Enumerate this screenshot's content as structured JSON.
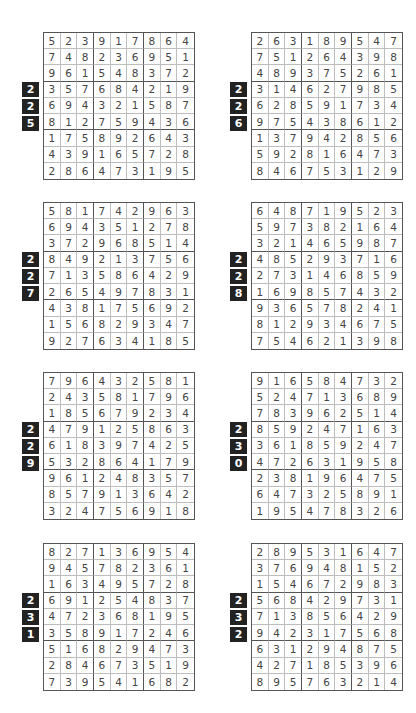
{
  "puzzles": [
    {
      "number": [
        "2",
        "2",
        "5"
      ],
      "rows": [
        [
          "5",
          "2",
          "3",
          "9",
          "1",
          "7",
          "8",
          "6",
          "4"
        ],
        [
          "7",
          "4",
          "8",
          "2",
          "3",
          "6",
          "9",
          "5",
          "1"
        ],
        [
          "9",
          "6",
          "1",
          "5",
          "4",
          "8",
          "3",
          "7",
          "2"
        ],
        [
          "3",
          "5",
          "7",
          "6",
          "8",
          "4",
          "2",
          "1",
          "9"
        ],
        [
          "6",
          "9",
          "4",
          "3",
          "2",
          "1",
          "5",
          "8",
          "7"
        ],
        [
          "8",
          "1",
          "2",
          "7",
          "5",
          "9",
          "4",
          "3",
          "6"
        ],
        [
          "1",
          "7",
          "5",
          "8",
          "9",
          "2",
          "6",
          "4",
          "3"
        ],
        [
          "4",
          "3",
          "9",
          "1",
          "6",
          "5",
          "7",
          "2",
          "8"
        ],
        [
          "2",
          "8",
          "6",
          "4",
          "7",
          "3",
          "1",
          "9",
          "5"
        ]
      ]
    },
    {
      "number": [
        "2",
        "2",
        "6"
      ],
      "rows": [
        [
          "2",
          "6",
          "3",
          "1",
          "8",
          "9",
          "5",
          "4",
          "7"
        ],
        [
          "7",
          "5",
          "1",
          "2",
          "6",
          "4",
          "3",
          "9",
          "8"
        ],
        [
          "4",
          "8",
          "9",
          "3",
          "7",
          "5",
          "2",
          "6",
          "1"
        ],
        [
          "3",
          "1",
          "4",
          "6",
          "2",
          "7",
          "9",
          "8",
          "5"
        ],
        [
          "6",
          "2",
          "8",
          "5",
          "9",
          "1",
          "7",
          "3",
          "4"
        ],
        [
          "9",
          "7",
          "5",
          "4",
          "3",
          "8",
          "6",
          "1",
          "2"
        ],
        [
          "1",
          "3",
          "7",
          "9",
          "4",
          "2",
          "8",
          "5",
          "6"
        ],
        [
          "5",
          "9",
          "2",
          "8",
          "1",
          "6",
          "4",
          "7",
          "3"
        ],
        [
          "8",
          "4",
          "6",
          "7",
          "5",
          "3",
          "1",
          "2",
          "9"
        ]
      ]
    },
    {
      "number": [
        "2",
        "2",
        "7"
      ],
      "rows": [
        [
          "5",
          "8",
          "1",
          "7",
          "4",
          "2",
          "9",
          "6",
          "3"
        ],
        [
          "6",
          "9",
          "4",
          "3",
          "5",
          "1",
          "2",
          "7",
          "8"
        ],
        [
          "3",
          "7",
          "2",
          "9",
          "6",
          "8",
          "5",
          "1",
          "4"
        ],
        [
          "8",
          "4",
          "9",
          "2",
          "1",
          "3",
          "7",
          "5",
          "6"
        ],
        [
          "7",
          "1",
          "3",
          "5",
          "8",
          "6",
          "4",
          "2",
          "9"
        ],
        [
          "2",
          "6",
          "5",
          "4",
          "9",
          "7",
          "8",
          "3",
          "1"
        ],
        [
          "4",
          "3",
          "8",
          "1",
          "7",
          "5",
          "6",
          "9",
          "2"
        ],
        [
          "1",
          "5",
          "6",
          "8",
          "2",
          "9",
          "3",
          "4",
          "7"
        ],
        [
          "9",
          "2",
          "7",
          "6",
          "3",
          "4",
          "1",
          "8",
          "5"
        ]
      ]
    },
    {
      "number": [
        "2",
        "2",
        "8"
      ],
      "rows": [
        [
          "6",
          "4",
          "8",
          "7",
          "1",
          "9",
          "5",
          "2",
          "3"
        ],
        [
          "5",
          "9",
          "7",
          "3",
          "8",
          "2",
          "1",
          "6",
          "4"
        ],
        [
          "3",
          "2",
          "1",
          "4",
          "6",
          "5",
          "9",
          "8",
          "7"
        ],
        [
          "4",
          "8",
          "5",
          "2",
          "9",
          "3",
          "7",
          "1",
          "6"
        ],
        [
          "2",
          "7",
          "3",
          "1",
          "4",
          "6",
          "8",
          "5",
          "9"
        ],
        [
          "1",
          "6",
          "9",
          "8",
          "5",
          "7",
          "4",
          "3",
          "2"
        ],
        [
          "9",
          "3",
          "6",
          "5",
          "7",
          "8",
          "2",
          "4",
          "1"
        ],
        [
          "8",
          "1",
          "2",
          "9",
          "3",
          "4",
          "6",
          "7",
          "5"
        ],
        [
          "7",
          "5",
          "4",
          "6",
          "2",
          "1",
          "3",
          "9",
          "8"
        ]
      ]
    },
    {
      "number": [
        "2",
        "2",
        "9"
      ],
      "rows": [
        [
          "7",
          "9",
          "6",
          "4",
          "3",
          "2",
          "5",
          "8",
          "1"
        ],
        [
          "2",
          "4",
          "3",
          "5",
          "8",
          "1",
          "7",
          "9",
          "6"
        ],
        [
          "1",
          "8",
          "5",
          "6",
          "7",
          "9",
          "2",
          "3",
          "4"
        ],
        [
          "4",
          "7",
          "9",
          "1",
          "2",
          "5",
          "8",
          "6",
          "3"
        ],
        [
          "6",
          "1",
          "8",
          "3",
          "9",
          "7",
          "4",
          "2",
          "5"
        ],
        [
          "5",
          "3",
          "2",
          "8",
          "6",
          "4",
          "1",
          "7",
          "9"
        ],
        [
          "9",
          "6",
          "1",
          "2",
          "4",
          "8",
          "3",
          "5",
          "7"
        ],
        [
          "8",
          "5",
          "7",
          "9",
          "1",
          "3",
          "6",
          "4",
          "2"
        ],
        [
          "3",
          "2",
          "4",
          "7",
          "5",
          "6",
          "9",
          "1",
          "8"
        ]
      ]
    },
    {
      "number": [
        "2",
        "3",
        "0"
      ],
      "rows": [
        [
          "9",
          "1",
          "6",
          "5",
          "8",
          "4",
          "7",
          "3",
          "2"
        ],
        [
          "5",
          "2",
          "4",
          "7",
          "1",
          "3",
          "6",
          "8",
          "9"
        ],
        [
          "7",
          "8",
          "3",
          "9",
          "6",
          "2",
          "5",
          "1",
          "4"
        ],
        [
          "8",
          "5",
          "9",
          "2",
          "4",
          "7",
          "1",
          "6",
          "3"
        ],
        [
          "3",
          "6",
          "1",
          "8",
          "5",
          "9",
          "2",
          "4",
          "7"
        ],
        [
          "4",
          "7",
          "2",
          "6",
          "3",
          "1",
          "9",
          "5",
          "8"
        ],
        [
          "2",
          "3",
          "8",
          "1",
          "9",
          "6",
          "4",
          "7",
          "5"
        ],
        [
          "6",
          "4",
          "7",
          "3",
          "2",
          "5",
          "8",
          "9",
          "1"
        ],
        [
          "1",
          "9",
          "5",
          "4",
          "7",
          "8",
          "3",
          "2",
          "6"
        ]
      ]
    },
    {
      "number": [
        "2",
        "3",
        "1"
      ],
      "rows": [
        [
          "8",
          "2",
          "7",
          "1",
          "3",
          "6",
          "9",
          "5",
          "4"
        ],
        [
          "9",
          "4",
          "5",
          "7",
          "8",
          "2",
          "3",
          "6",
          "1"
        ],
        [
          "1",
          "6",
          "3",
          "4",
          "9",
          "5",
          "7",
          "2",
          "8"
        ],
        [
          "6",
          "9",
          "1",
          "2",
          "5",
          "4",
          "8",
          "3",
          "7"
        ],
        [
          "4",
          "7",
          "2",
          "3",
          "6",
          "8",
          "1",
          "9",
          "5"
        ],
        [
          "3",
          "5",
          "8",
          "9",
          "1",
          "7",
          "2",
          "4",
          "6"
        ],
        [
          "5",
          "1",
          "6",
          "8",
          "2",
          "9",
          "4",
          "7",
          "3"
        ],
        [
          "2",
          "8",
          "4",
          "6",
          "7",
          "3",
          "5",
          "1",
          "9"
        ],
        [
          "7",
          "3",
          "9",
          "5",
          "4",
          "1",
          "6",
          "8",
          "2"
        ]
      ]
    },
    {
      "number": [
        "2",
        "3",
        "2"
      ],
      "rows": [
        [
          "2",
          "8",
          "9",
          "5",
          "3",
          "1",
          "6",
          "4",
          "7"
        ],
        [
          "3",
          "7",
          "6",
          "9",
          "4",
          "8",
          "1",
          "5",
          "2"
        ],
        [
          "1",
          "5",
          "4",
          "6",
          "7",
          "2",
          "9",
          "8",
          "3"
        ],
        [
          "5",
          "6",
          "8",
          "4",
          "2",
          "9",
          "7",
          "3",
          "1"
        ],
        [
          "7",
          "1",
          "3",
          "8",
          "5",
          "6",
          "4",
          "2",
          "9"
        ],
        [
          "9",
          "4",
          "2",
          "3",
          "1",
          "7",
          "5",
          "6",
          "8"
        ],
        [
          "6",
          "3",
          "1",
          "2",
          "9",
          "4",
          "8",
          "7",
          "5"
        ],
        [
          "4",
          "2",
          "7",
          "1",
          "8",
          "5",
          "3",
          "9",
          "6"
        ],
        [
          "8",
          "9",
          "5",
          "7",
          "6",
          "3",
          "2",
          "1",
          "4"
        ]
      ]
    }
  ]
}
